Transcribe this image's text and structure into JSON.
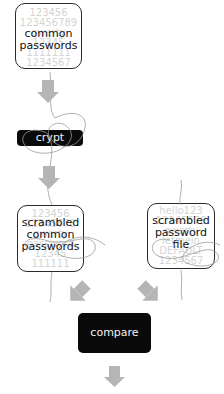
{
  "diagram": {
    "nodes": {
      "common_passwords": {
        "label_line1": "common",
        "label_line2": "passwords",
        "bg_values": [
          "123456",
          "123456789",
          "qwerty",
          "12345",
          "1111111",
          "1234567"
        ]
      },
      "crypt": {
        "label": "crypt"
      },
      "scrambled_common": {
        "label_line1": "scrambled",
        "label_line2": "common",
        "label_line3": "passwords",
        "bg_values": [
          "123456",
          "12345678",
          "qwerty",
          "password",
          "12345",
          "111111"
        ]
      },
      "scrambled_file": {
        "label_line1": "scrambled",
        "label_line2": "password",
        "label_line3": "file",
        "bg_values": [
          "hello123",
          "12345678",
          "qwerty",
          "letmein",
          "DEFAULT",
          "1234567"
        ]
      },
      "compare": {
        "label": "compare"
      }
    },
    "colors": {
      "arrow": "#b5b5b5",
      "box_border": "#2a2a2a",
      "dark_node": "#0a0a0a",
      "scribble": "#9a9a9a",
      "bg_text": "#d4d4d4"
    }
  }
}
